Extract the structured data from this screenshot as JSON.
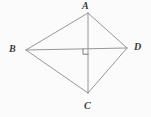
{
  "figure": {
    "background_color": "#fbfbfb",
    "stroke_color": "#8b8b8b",
    "stroke_color_dark": "#6f6f6f",
    "label_color": "#3a3a3a",
    "stroke_width": 0.9,
    "labels": {
      "a": "A",
      "b": "B",
      "c": "C",
      "d": "D"
    },
    "vertices": {
      "a": {
        "x": 88,
        "y": 13
      },
      "b": {
        "x": 26,
        "y": 50
      },
      "c": {
        "x": 88,
        "y": 93
      },
      "d": {
        "x": 127,
        "y": 48
      }
    },
    "intersection": {
      "x": 88,
      "y": 49
    },
    "right_angle_marker": {
      "name": "right-angle-square",
      "size": 5,
      "position": "lower-left-of-intersection"
    },
    "sides": [
      {
        "name": "side-ab",
        "from": "a",
        "to": "b"
      },
      {
        "name": "side-ad",
        "from": "a",
        "to": "d"
      },
      {
        "name": "side-bc",
        "from": "b",
        "to": "c"
      },
      {
        "name": "side-cd",
        "from": "c",
        "to": "d"
      }
    ],
    "diagonals": [
      {
        "name": "diagonal-ac",
        "from": "a",
        "to": "c",
        "orientation": "vertical"
      },
      {
        "name": "diagonal-bd",
        "from": "b",
        "to": "d",
        "orientation": "horizontal"
      }
    ]
  }
}
